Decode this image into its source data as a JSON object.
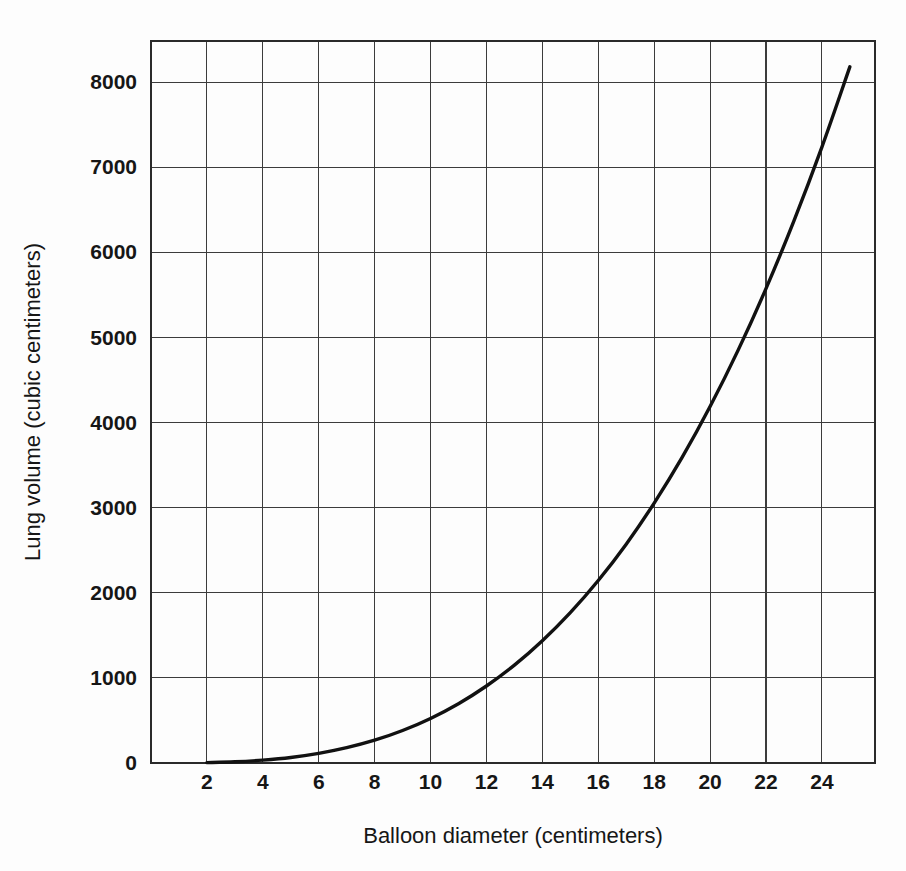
{
  "chart_data": {
    "type": "line",
    "title": "",
    "xlabel": "Balloon diameter (centimeters)",
    "ylabel": "Lung volume (cubic centimeters)",
    "xlim": [
      0,
      25.9
    ],
    "ylim": [
      0,
      8485
    ],
    "grid": true,
    "legend": null,
    "x_ticks": [
      2,
      4,
      6,
      8,
      10,
      12,
      14,
      16,
      18,
      20,
      22,
      24
    ],
    "x_tick_labels": [
      "2",
      "4",
      "6",
      "8",
      "10",
      "12",
      "14",
      "16",
      "18",
      "20",
      "22",
      "24"
    ],
    "y_ticks": [
      0,
      1000,
      2000,
      3000,
      4000,
      5000,
      6000,
      7000,
      8000
    ],
    "y_tick_labels": [
      "0",
      "1000",
      "2000",
      "3000",
      "4000",
      "5000",
      "6000",
      "7000",
      "8000"
    ],
    "series": [
      {
        "name": "Lung volume vs balloon diameter",
        "color": "#111111",
        "x": [
          2,
          3,
          4,
          5,
          6,
          7,
          8,
          9,
          10,
          11,
          12,
          13,
          14,
          15,
          16,
          17,
          18,
          19,
          20,
          21,
          22,
          23,
          24,
          25
        ],
        "y": [
          4,
          14,
          34,
          65,
          113,
          180,
          268,
          382,
          524,
          697,
          905,
          1150,
          1437,
          1767,
          2145,
          2572,
          3054,
          3591,
          4189,
          4849,
          5575,
          6371,
          7238,
          8181
        ]
      }
    ]
  },
  "axes": {
    "x_title": "Balloon diameter (centimeters)",
    "y_title": "Lung volume (cubic centimeters)"
  },
  "colors": {
    "curve": "#111111",
    "grid": "#3c3c3c",
    "frame": "#2a2a2a",
    "background": "#fdfdfd",
    "text": "#161616"
  }
}
